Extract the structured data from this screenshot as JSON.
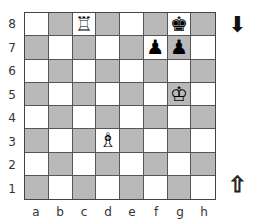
{
  "board": {
    "ranks": [
      "8",
      "7",
      "6",
      "5",
      "4",
      "3",
      "2",
      "1"
    ],
    "files": [
      "a",
      "b",
      "c",
      "d",
      "e",
      "f",
      "g",
      "h"
    ],
    "colors": {
      "light": "#ffffff",
      "dark": "#b9b9b9"
    },
    "squares": [
      [
        "",
        "",
        "♖",
        "",
        "",
        "",
        "♚",
        ""
      ],
      [
        "",
        "",
        "",
        "",
        "",
        "♟",
        "♟",
        ""
      ],
      [
        "",
        "",
        "",
        "",
        "",
        "",
        "",
        ""
      ],
      [
        "",
        "",
        "",
        "",
        "",
        "",
        "♔",
        ""
      ],
      [
        "",
        "",
        "",
        "",
        "",
        "",
        "",
        ""
      ],
      [
        "",
        "",
        "",
        "♗",
        "",
        "",
        "",
        ""
      ],
      [
        "",
        "",
        "",
        "",
        "",
        "",
        "",
        ""
      ],
      [
        "",
        "",
        "",
        "",
        "",
        "",
        "",
        ""
      ]
    ],
    "pieces": [
      {
        "square": "c8",
        "piece": "white-rook"
      },
      {
        "square": "g8",
        "piece": "black-king"
      },
      {
        "square": "f7",
        "piece": "black-pawn"
      },
      {
        "square": "g7",
        "piece": "black-pawn"
      },
      {
        "square": "g5",
        "piece": "white-king"
      },
      {
        "square": "d3",
        "piece": "white-bishop"
      }
    ]
  },
  "indicators": {
    "black_arrow": "⬇",
    "white_arrow": "⇧"
  }
}
